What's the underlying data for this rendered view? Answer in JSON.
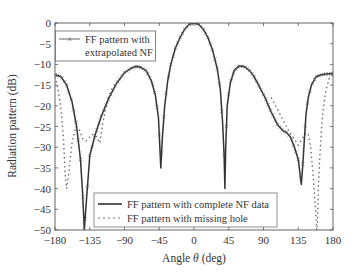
{
  "chart_data": {
    "type": "line",
    "title": "",
    "xlabel": "Angle θ (deg)",
    "ylabel": "Radiation pattern (dB)",
    "xlim": [
      -180,
      180
    ],
    "ylim": [
      -50,
      0
    ],
    "xticks": [
      -180,
      -135,
      -90,
      -45,
      0,
      45,
      90,
      135,
      180
    ],
    "yticks": [
      0,
      -5,
      -10,
      -15,
      -20,
      -25,
      -30,
      -35,
      -40,
      -45,
      -50
    ],
    "grid": false,
    "legends": [
      {
        "position": "upper-left",
        "entries": [
          "FF pattern with extrapolated NF"
        ]
      },
      {
        "position": "lower-center",
        "entries": [
          "FF pattern with complete NF data",
          "FF pattern with missing hole"
        ]
      }
    ],
    "series": [
      {
        "name": "FF pattern with complete NF data",
        "style": "solid",
        "color": "#333333",
        "x": [
          -180,
          -172,
          -165,
          -158,
          -152,
          -147,
          -144,
          -142,
          -139,
          -135,
          -128,
          -120,
          -110,
          -100,
          -90,
          -80,
          -75,
          -70,
          -62,
          -55,
          -50,
          -46,
          -43,
          -41,
          -38,
          -34,
          -30,
          -24,
          -18,
          -12,
          -6,
          0,
          6,
          12,
          18,
          24,
          30,
          34,
          37,
          39,
          40,
          41,
          43,
          47,
          52,
          58,
          65,
          72,
          78,
          85,
          92,
          100,
          108,
          115,
          120,
          125,
          130,
          135,
          139,
          141,
          143,
          145,
          148,
          152,
          158,
          165,
          172,
          180
        ],
        "y": [
          -12.5,
          -13,
          -15,
          -19,
          -25,
          -33,
          -42,
          -50,
          -42,
          -32,
          -27,
          -22.5,
          -18,
          -14.5,
          -12,
          -10.8,
          -10.5,
          -10.6,
          -11.5,
          -14,
          -17.5,
          -23,
          -35,
          -28,
          -20,
          -14,
          -10,
          -6,
          -3.5,
          -1.5,
          -0.3,
          0,
          -0.3,
          -1.5,
          -3.5,
          -6.5,
          -11,
          -16,
          -24,
          -32,
          -40,
          -30,
          -20,
          -14.5,
          -11.5,
          -10.4,
          -10.5,
          -11.5,
          -13,
          -15.5,
          -18,
          -21.5,
          -24.5,
          -26,
          -26.5,
          -27.5,
          -30,
          -33,
          -39,
          -34,
          -28,
          -22,
          -18,
          -15,
          -13,
          -12.5,
          -12.3,
          -12.2
        ]
      },
      {
        "name": "FF pattern with missing hole",
        "style": "dotted",
        "color": "#666666",
        "x": [
          -180,
          -176,
          -172,
          -169,
          -167,
          -165,
          -162,
          -158,
          -153,
          -148,
          -144,
          -140,
          -135,
          -130,
          -126,
          -122,
          -118,
          -112,
          -105,
          -100,
          100,
          110,
          118,
          124,
          130,
          135,
          140,
          145,
          148,
          151,
          154,
          157,
          159,
          160,
          161,
          163,
          166,
          170,
          175,
          180
        ],
        "y": [
          -13,
          -16,
          -21,
          -28,
          -36,
          -40,
          -36,
          -29,
          -25,
          -26,
          -28,
          -28.5,
          -27.5,
          -26.8,
          -27.5,
          -29,
          -24,
          -18.5,
          -15.5,
          -14.5,
          -18,
          -21.5,
          -24.5,
          -26.5,
          -28,
          -29.5,
          -28,
          -26.5,
          -27,
          -30,
          -36,
          -44,
          -50,
          -48,
          -40,
          -32,
          -23,
          -17,
          -13.5,
          -12.5
        ]
      },
      {
        "name": "FF pattern with extrapolated NF",
        "style": "x-markers",
        "color": "#444444",
        "note": "Markers follow the complete-NF-data curve closely across the full angular range"
      }
    ]
  },
  "axes": {
    "xlabel_text": "Angle ",
    "xlabel_symbol": "θ",
    "xlabel_unit": " (deg)",
    "ylabel": "Radiation pattern (dB)"
  },
  "legend_top": {
    "line1": "FF pattern with",
    "line2": "extrapolated NF"
  },
  "legend_bottom": {
    "entry1": "FF pattern with complete NF data",
    "entry2": "FF pattern with missing hole"
  }
}
